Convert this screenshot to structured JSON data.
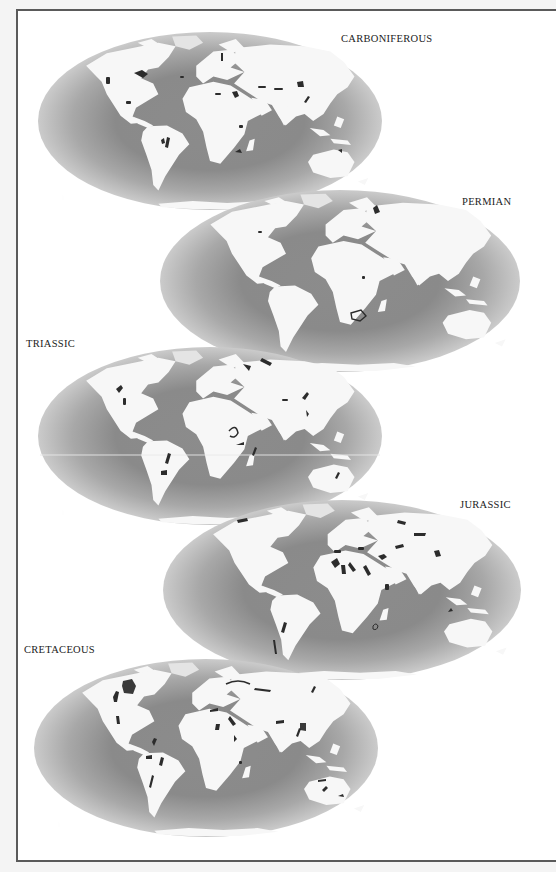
{
  "figure": {
    "type": "paleogeographic map series",
    "projection": "elliptical (Mollweide-style) world maps",
    "colors": {
      "page_background": "#ffffff",
      "frame_border": "#5a5a5a",
      "ocean_edge": "#c8c8c8",
      "ocean_coast": "#7e7e7e",
      "land": "#f7f7f7",
      "deposits": "#2c2c2c",
      "label_text": "#222222"
    },
    "maps": [
      {
        "id": "carboniferous",
        "label": "CARBONIFEROUS",
        "order": 1,
        "ellipse": {
          "cx": 210,
          "cy": 121,
          "rx": 172,
          "ry": 89
        },
        "label_pos": {
          "x": 340,
          "y": 34
        }
      },
      {
        "id": "permian",
        "label": "PERMIAN",
        "order": 2,
        "ellipse": {
          "cx": 340,
          "cy": 281,
          "rx": 180,
          "ry": 91
        },
        "label_pos": {
          "x": 462,
          "y": 197
        }
      },
      {
        "id": "triassic",
        "label": "TRIASSIC",
        "order": 3,
        "ellipse": {
          "cx": 210,
          "cy": 436,
          "rx": 172,
          "ry": 89
        },
        "label_pos": {
          "x": 26,
          "y": 339
        }
      },
      {
        "id": "jurassic",
        "label": "JURASSIC",
        "order": 4,
        "ellipse": {
          "cx": 342,
          "cy": 590,
          "rx": 179,
          "ry": 90
        },
        "label_pos": {
          "x": 459,
          "y": 500
        }
      },
      {
        "id": "cretaceous",
        "label": "CRETACEOUS",
        "order": 5,
        "ellipse": {
          "cx": 206,
          "cy": 748,
          "rx": 172,
          "ry": 89
        },
        "label_pos": {
          "x": 24,
          "y": 645
        }
      }
    ]
  }
}
